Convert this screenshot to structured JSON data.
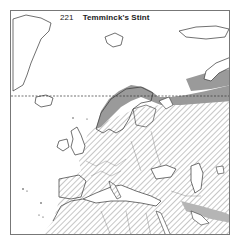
{
  "map": {
    "number": "221",
    "species": "Temminck's Stint",
    "legend": {
      "breeding_range": {
        "fill": "#9a9a9a",
        "pattern": "solid"
      },
      "non_breeding_range": {
        "fill": "#bdbdbd",
        "pattern": "diagonal-hatch"
      },
      "arctic_circle": {
        "style": "dashed"
      }
    },
    "colors": {
      "coast": "#333333",
      "border": "#777777",
      "background": "#ffffff"
    }
  }
}
